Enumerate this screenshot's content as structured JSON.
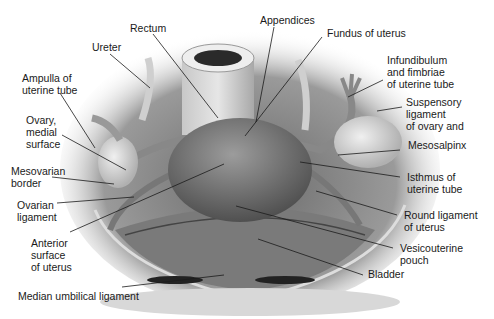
{
  "figure": {
    "labels": [
      {
        "id": "rectum",
        "text": "Rectum",
        "x": 130,
        "y": 22,
        "lx1": 153,
        "ly1": 34,
        "lx2": 218,
        "ly2": 118
      },
      {
        "id": "appendices",
        "text": "Appendices",
        "x": 260,
        "y": 14,
        "lx1": 274,
        "ly1": 27,
        "lx2": 256,
        "ly2": 122
      },
      {
        "id": "fundus",
        "text": "Fundus of uterus",
        "x": 327,
        "y": 27,
        "lx1": 322,
        "ly1": 37,
        "lx2": 245,
        "ly2": 136
      },
      {
        "id": "ureter",
        "text": "Ureter",
        "x": 92,
        "y": 41,
        "lx1": 110,
        "ly1": 54,
        "lx2": 150,
        "ly2": 88
      },
      {
        "id": "infundibulum",
        "text": "Infundibulum\nand fimbriae\nof uterine tube",
        "x": 387,
        "y": 54,
        "lx1": 383,
        "ly1": 80,
        "lx2": 348,
        "ly2": 97
      },
      {
        "id": "ampulla",
        "text": "Ampulla of\nuterine tube",
        "x": 22,
        "y": 72,
        "lx1": 60,
        "ly1": 93,
        "lx2": 95,
        "ly2": 148
      },
      {
        "id": "suspensory",
        "text": "Suspensory\nligament\nof ovary and",
        "x": 406,
        "y": 96,
        "lx1": 402,
        "ly1": 107,
        "lx2": 377,
        "ly2": 111
      },
      {
        "id": "ovary",
        "text": "Ovary,\nmedial\nsurface",
        "x": 26,
        "y": 114,
        "lx1": 62,
        "ly1": 135,
        "lx2": 126,
        "ly2": 170
      },
      {
        "id": "mesosalpinx",
        "text": "Mesosalpinx",
        "x": 408,
        "y": 139,
        "lx1": 400,
        "ly1": 150,
        "lx2": 338,
        "ly2": 155
      },
      {
        "id": "mesovarian",
        "text": "Mesovarian\nborder",
        "x": 11,
        "y": 165,
        "lx1": 52,
        "ly1": 177,
        "lx2": 114,
        "ly2": 184
      },
      {
        "id": "isthmus",
        "text": "Isthmus of\nuterine tube",
        "x": 407,
        "y": 171,
        "lx1": 400,
        "ly1": 177,
        "lx2": 300,
        "ly2": 162
      },
      {
        "id": "ovarian_lig",
        "text": "Ovarian\nligament",
        "x": 17,
        "y": 199,
        "lx1": 57,
        "ly1": 203,
        "lx2": 134,
        "ly2": 197
      },
      {
        "id": "round_lig",
        "text": "Round ligament\nof uterus",
        "x": 404,
        "y": 209,
        "lx1": 397,
        "ly1": 215,
        "lx2": 316,
        "ly2": 191
      },
      {
        "id": "anterior",
        "text": "Anterior\nsurface\nof uterus",
        "x": 31,
        "y": 237,
        "lx1": 70,
        "ly1": 232,
        "lx2": 224,
        "ly2": 164
      },
      {
        "id": "vesicouterine",
        "text": "Vesicouterine\npouch",
        "x": 400,
        "y": 242,
        "lx1": 393,
        "ly1": 248,
        "lx2": 236,
        "ly2": 206
      },
      {
        "id": "bladder",
        "text": "Bladder",
        "x": 368,
        "y": 268,
        "lx1": 363,
        "ly1": 275,
        "lx2": 258,
        "ly2": 239
      },
      {
        "id": "median_umb",
        "text": "Median umbilical ligament",
        "x": 18,
        "y": 290,
        "lx1": 122,
        "ly1": 287,
        "lx2": 224,
        "ly2": 275
      }
    ]
  }
}
